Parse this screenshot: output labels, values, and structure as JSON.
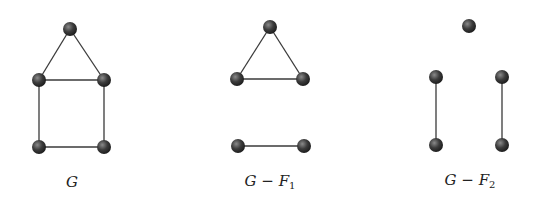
{
  "figure": {
    "panels": [
      {
        "id": "G",
        "caption": "G",
        "nodes": [
          [
            70,
            29
          ],
          [
            39,
            80
          ],
          [
            104,
            80
          ],
          [
            39,
            147
          ],
          [
            104,
            147
          ]
        ],
        "edges": [
          [
            0,
            1
          ],
          [
            0,
            2
          ],
          [
            1,
            2
          ],
          [
            1,
            3
          ],
          [
            2,
            4
          ],
          [
            3,
            4
          ]
        ]
      },
      {
        "id": "G-F1",
        "caption": "G − F",
        "caption_sub": "1",
        "nodes": [
          [
            270,
            27
          ],
          [
            237,
            79
          ],
          [
            303,
            79
          ],
          [
            238,
            146
          ],
          [
            304,
            146
          ]
        ],
        "edges": [
          [
            0,
            1
          ],
          [
            0,
            2
          ],
          [
            1,
            2
          ],
          [
            3,
            4
          ]
        ]
      },
      {
        "id": "G-F2",
        "caption": "G − F",
        "caption_sub": "2",
        "nodes": [
          [
            469,
            26
          ],
          [
            436,
            77
          ],
          [
            502,
            77
          ],
          [
            436,
            145
          ],
          [
            502,
            145
          ]
        ],
        "edges": [
          [
            1,
            3
          ],
          [
            2,
            4
          ]
        ]
      }
    ],
    "node_color": "#3c3c3c",
    "node_highlight": "#8a8a8a",
    "edge_color": "#3a3a3a"
  }
}
